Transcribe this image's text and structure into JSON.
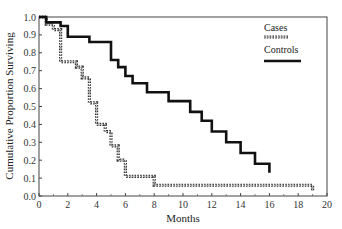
{
  "chart_data": {
    "type": "line",
    "subtype": "kaplan-meier-step",
    "title": "",
    "xlabel": "Months",
    "ylabel": "Cumulative Proportion Surviving",
    "xlim": [
      0,
      20
    ],
    "ylim": [
      0.0,
      1.0
    ],
    "x_ticks": [
      0,
      2,
      4,
      6,
      8,
      10,
      12,
      14,
      16,
      18,
      20
    ],
    "y_ticks": [
      "0.0",
      "0.1",
      "0.2",
      "0.3",
      "0.4",
      "0.5",
      "0.6",
      "0.7",
      "0.8",
      "0.9",
      "1.0"
    ],
    "grid": false,
    "legend_position": "upper right",
    "series": [
      {
        "name": "Cases",
        "style": "dotted-hollow",
        "color": "#333333",
        "steps": [
          [
            0,
            1.0
          ],
          [
            0.5,
            0.96
          ],
          [
            1.0,
            0.93
          ],
          [
            1.5,
            0.75
          ],
          [
            2.6,
            0.72
          ],
          [
            3.0,
            0.66
          ],
          [
            3.5,
            0.52
          ],
          [
            4.0,
            0.4
          ],
          [
            4.6,
            0.36
          ],
          [
            5.0,
            0.28
          ],
          [
            5.5,
            0.2
          ],
          [
            6.0,
            0.11
          ],
          [
            8.0,
            0.06
          ],
          [
            19.0,
            0.03
          ]
        ],
        "end_x": 19.0
      },
      {
        "name": "Controls",
        "style": "solid",
        "color": "#111111",
        "steps": [
          [
            0,
            1.0
          ],
          [
            0.5,
            0.97
          ],
          [
            1.5,
            0.95
          ],
          [
            2.0,
            0.89
          ],
          [
            3.5,
            0.86
          ],
          [
            5.0,
            0.76
          ],
          [
            5.5,
            0.72
          ],
          [
            6.0,
            0.67
          ],
          [
            6.5,
            0.63
          ],
          [
            7.5,
            0.58
          ],
          [
            9.0,
            0.53
          ],
          [
            10.5,
            0.47
          ],
          [
            11.3,
            0.42
          ],
          [
            12.0,
            0.36
          ],
          [
            13.0,
            0.3
          ],
          [
            14.0,
            0.24
          ],
          [
            15.0,
            0.18
          ],
          [
            16.0,
            0.13
          ]
        ],
        "end_x": 16.0
      }
    ]
  },
  "legend": {
    "cases_label": "Cases",
    "controls_label": "Controls"
  },
  "axes": {
    "xlabel": "Months",
    "ylabel": "Cumulative Proportion Surviving"
  }
}
